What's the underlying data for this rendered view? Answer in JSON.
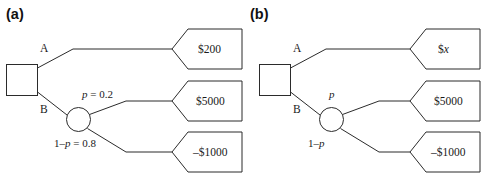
{
  "figure": {
    "type": "decision-tree-diagram",
    "background_color": "#ffffff",
    "line_color": "#2b2b2b",
    "text_color": "#1a1a1a"
  },
  "panels": [
    {
      "id": "a",
      "label": "(a)",
      "decision_node": {
        "shape": "square",
        "name": "decision-node"
      },
      "chance_node": {
        "shape": "circle",
        "name": "chance-node"
      },
      "branches": [
        {
          "key": "A",
          "label": "A",
          "payoff": "$200"
        },
        {
          "key": "B",
          "label": "B"
        }
      ],
      "probabilities": [
        {
          "label": "p = 0.2",
          "p_symbol": "p",
          "rest": " = 0.2",
          "payoff": "$5000"
        },
        {
          "label": "1–p = 0.8",
          "prefix": "1–",
          "p_symbol": "p",
          "rest": " = 0.8",
          "payoff": "–$1000"
        }
      ],
      "payoffs": [
        {
          "name": "payoff-a-top",
          "text": "$200"
        },
        {
          "name": "payoff-a-middle",
          "text": "$5000"
        },
        {
          "name": "payoff-a-bottom",
          "text": "–$1000"
        }
      ]
    },
    {
      "id": "b",
      "label": "(b)",
      "decision_node": {
        "shape": "square",
        "name": "decision-node"
      },
      "chance_node": {
        "shape": "circle",
        "name": "chance-node"
      },
      "branches": [
        {
          "key": "A",
          "label": "A",
          "payoff": "$x"
        },
        {
          "key": "B",
          "label": "B"
        }
      ],
      "probabilities": [
        {
          "label": "p",
          "p_symbol": "p",
          "rest": "",
          "payoff": "$5000"
        },
        {
          "label": "1–p",
          "prefix": "1–",
          "p_symbol": "p",
          "rest": "",
          "payoff": "–$1000"
        }
      ],
      "payoffs": [
        {
          "name": "payoff-b-top",
          "prefix": "$",
          "symbol": "x",
          "text": "$x"
        },
        {
          "name": "payoff-b-middle",
          "text": "$5000"
        },
        {
          "name": "payoff-b-bottom",
          "text": "–$1000"
        }
      ]
    }
  ]
}
